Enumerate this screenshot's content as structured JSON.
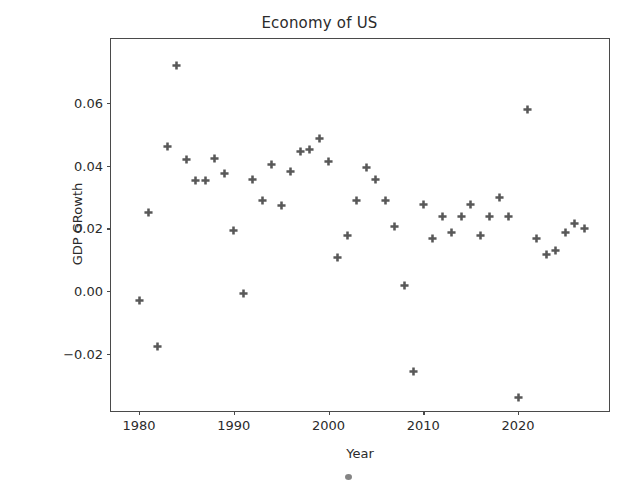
{
  "chart_data": {
    "type": "scatter",
    "title": "Economy of US",
    "xlabel": "Year",
    "ylabel": "GDP GRowth",
    "xlim": [
      1978.1,
      1978.1
    ],
    "ylim": [
      -0.0395,
      0.0795
    ],
    "xticks": [
      1980,
      1990,
      2000,
      2010,
      2020
    ],
    "xticklabels": [
      "1980",
      "1990",
      "2000",
      "2010",
      "2020"
    ],
    "yticks": [
      -0.02,
      0.0,
      0.02,
      0.04,
      0.06
    ],
    "yticklabels": [
      "−0.02",
      "0.00",
      "0.02",
      "0.04",
      "0.06"
    ],
    "grid": false,
    "legend": null,
    "marker": "plus-filled",
    "marker_color": "#585858",
    "x": [
      1980,
      1981,
      1982,
      1983,
      1984,
      1985,
      1986,
      1987,
      1988,
      1989,
      1990,
      1991,
      1992,
      1993,
      1994,
      1995,
      1996,
      1997,
      1998,
      1999,
      2000,
      2001,
      2002,
      2003,
      2004,
      2005,
      2006,
      2007,
      2008,
      2009,
      2010,
      2011,
      2012,
      2013,
      2014,
      2015,
      2016,
      2017,
      2018,
      2019,
      2020,
      2021,
      2022,
      2023,
      2024,
      2025,
      2026,
      2027
    ],
    "y": [
      -0.0031,
      0.0252,
      -0.0177,
      0.0461,
      0.0719,
      0.0421,
      0.0354,
      0.0354,
      0.0423,
      0.0374,
      0.0194,
      -0.0007,
      0.0355,
      0.0288,
      0.0404,
      0.0274,
      0.0381,
      0.0445,
      0.0451,
      0.0488,
      0.0414,
      0.0106,
      0.0178,
      0.0288,
      0.0394,
      0.0355,
      0.0289,
      0.0206,
      0.0018,
      -0.0258,
      0.0277,
      0.0168,
      0.0239,
      0.0188,
      0.0239,
      0.0277,
      0.0178,
      0.0239,
      0.0299,
      0.0239,
      -0.0341,
      0.0579,
      0.0168,
      0.0117,
      0.0129,
      0.0188,
      0.0214,
      0.0199
    ]
  },
  "figure": {
    "title": "Economy of US",
    "xaxis_label": "Year",
    "yaxis_label": "GDP GRowth"
  }
}
